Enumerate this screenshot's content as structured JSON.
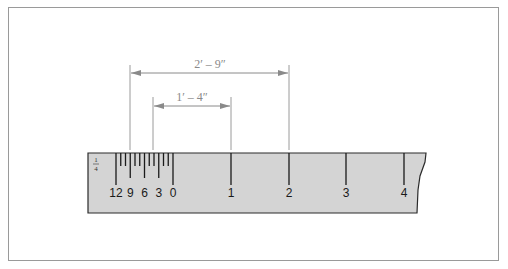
{
  "figure": {
    "type": "architect-scale-reading-diagram",
    "dimensions": [
      {
        "label": "2′ – 9″",
        "from_x": 130,
        "to_x": 289,
        "y": 73
      },
      {
        "label": "1′ – 4″",
        "from_x": 153,
        "to_x": 231,
        "y": 106
      }
    ],
    "scale": {
      "fraction_label": "1/4",
      "fraction_numerator": "1",
      "fraction_denominator": "4",
      "inch_subdivision_labels": [
        "12",
        "9",
        "6",
        "3",
        "0"
      ],
      "foot_labels": [
        "1",
        "2",
        "3",
        "4"
      ]
    },
    "colors": {
      "ruler_fill": "#d4d4d4",
      "ruler_stroke": "#2a2a2a",
      "dimension_line": "#8a8a8a",
      "frame_border": "#9a9a9a"
    }
  }
}
